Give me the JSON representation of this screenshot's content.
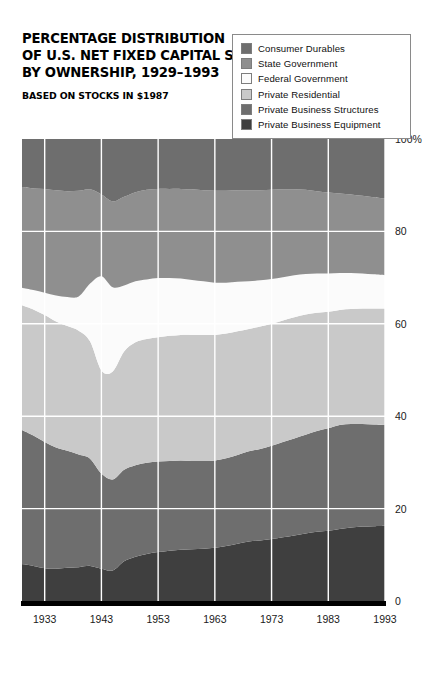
{
  "title": {
    "lines": [
      "PERCENTAGE DISTRIBUTION",
      "OF U.S. NET FIXED CAPITAL STOCK,",
      "BY OWNERSHIP, 1929–1993"
    ],
    "subtitle": "BASED ON STOCKS IN $1987"
  },
  "legend": {
    "items": [
      {
        "label": "Consumer Durables",
        "color": "#6e6e6e"
      },
      {
        "label": "State Government",
        "color": "#8f8f8f"
      },
      {
        "label": "Federal Government",
        "color": "#fbfbfb"
      },
      {
        "label": "Private Residential",
        "color": "#c9c9c9"
      },
      {
        "label": "Private Business Structures",
        "color": "#6e6e6e"
      },
      {
        "label": "Private Business Equipment",
        "color": "#3f3f3f"
      }
    ]
  },
  "chart_data": {
    "type": "area",
    "title": "PERCENTAGE DISTRIBUTION OF U.S. NET FIXED CAPITAL STOCK, BY OWNERSHIP, 1929–1993",
    "subtitle": "BASED ON STOCKS IN $1987",
    "stacked": true,
    "stack_order_bottom_to_top": [
      "Private Business Equipment",
      "Private Business Structures",
      "Private Residential",
      "Federal Government",
      "State Government",
      "Consumer Durables"
    ],
    "xlabel": "",
    "ylabel": "",
    "ylim": [
      0,
      100
    ],
    "yticks": [
      0,
      20,
      40,
      60,
      80,
      100
    ],
    "ytick_labels": [
      "0",
      "20",
      "40",
      "60",
      "80",
      "100%"
    ],
    "xlim": [
      1929,
      1993
    ],
    "xticks": [
      1933,
      1943,
      1953,
      1963,
      1973,
      1983,
      1993
    ],
    "xtick_labels": [
      "1933",
      "1943",
      "1953",
      "1963",
      "1973",
      "1983",
      "1993"
    ],
    "grid": true,
    "grid_color": "#ffffff",
    "legend_position": "top-right",
    "x": [
      1929,
      1931,
      1933,
      1935,
      1937,
      1939,
      1941,
      1943,
      1945,
      1947,
      1949,
      1951,
      1953,
      1955,
      1957,
      1959,
      1961,
      1963,
      1965,
      1967,
      1969,
      1971,
      1973,
      1975,
      1977,
      1979,
      1981,
      1983,
      1985,
      1987,
      1989,
      1991,
      1993
    ],
    "series": [
      {
        "name": "Private Business Equipment",
        "color": "#3f3f3f",
        "values": [
          8.0,
          7.6,
          7.1,
          7.0,
          7.2,
          7.3,
          7.6,
          7.0,
          6.6,
          8.6,
          9.6,
          10.2,
          10.6,
          10.9,
          11.1,
          11.2,
          11.3,
          11.5,
          11.9,
          12.4,
          12.9,
          13.1,
          13.4,
          13.8,
          14.2,
          14.6,
          15.0,
          15.2,
          15.6,
          15.9,
          16.1,
          16.2,
          16.3
        ]
      },
      {
        "name": "Private Business Structures",
        "color": "#6e6e6e",
        "values": [
          29.0,
          28.2,
          27.3,
          26.2,
          25.3,
          24.4,
          23.2,
          20.6,
          19.7,
          19.8,
          19.8,
          19.7,
          19.6,
          19.4,
          19.3,
          19.1,
          19.0,
          18.9,
          19.0,
          19.2,
          19.5,
          19.8,
          20.2,
          20.6,
          21.0,
          21.4,
          21.8,
          22.2,
          22.5,
          22.4,
          22.2,
          22.0,
          21.8
        ]
      },
      {
        "name": "Private Residential",
        "color": "#c9c9c9",
        "values": [
          27.0,
          27.3,
          27.5,
          27.3,
          27.0,
          26.8,
          25.4,
          22.3,
          23.4,
          25.6,
          26.6,
          26.8,
          26.9,
          27.1,
          27.2,
          27.3,
          27.3,
          27.2,
          27.0,
          26.8,
          26.5,
          26.5,
          26.4,
          26.3,
          26.2,
          26.0,
          25.6,
          25.2,
          24.9,
          24.9,
          25.0,
          25.1,
          25.2
        ]
      },
      {
        "name": "Federal Government",
        "color": "#fbfbfb",
        "values": [
          3.8,
          4.2,
          4.8,
          5.6,
          6.3,
          7.4,
          12.5,
          20.4,
          18.2,
          14.3,
          13.2,
          12.9,
          12.8,
          12.5,
          12.2,
          11.9,
          11.6,
          11.3,
          11.0,
          10.7,
          10.3,
          10.0,
          9.7,
          9.4,
          9.1,
          8.8,
          8.5,
          8.3,
          8.0,
          7.8,
          7.6,
          7.4,
          7.2
        ]
      },
      {
        "name": "State Government",
        "color": "#8f8f8f",
        "values": [
          21.8,
          22.0,
          22.5,
          22.8,
          22.9,
          22.9,
          20.4,
          17.7,
          18.6,
          19.2,
          19.3,
          19.4,
          19.3,
          19.3,
          19.4,
          19.6,
          19.7,
          19.9,
          19.9,
          19.8,
          19.7,
          19.5,
          19.3,
          19.0,
          18.6,
          18.2,
          17.8,
          17.5,
          17.2,
          17.0,
          16.8,
          16.7,
          16.6
        ]
      },
      {
        "name": "Consumer Durables",
        "color": "#6e6e6e",
        "values": [
          10.4,
          10.7,
          10.8,
          11.1,
          11.3,
          11.2,
          10.9,
          12.0,
          13.5,
          12.5,
          11.5,
          11.0,
          10.8,
          10.8,
          10.8,
          10.9,
          11.1,
          11.2,
          11.2,
          11.1,
          11.1,
          11.1,
          11.0,
          10.9,
          10.9,
          11.0,
          11.3,
          11.6,
          11.8,
          12.0,
          12.3,
          12.6,
          12.9
        ]
      }
    ]
  }
}
